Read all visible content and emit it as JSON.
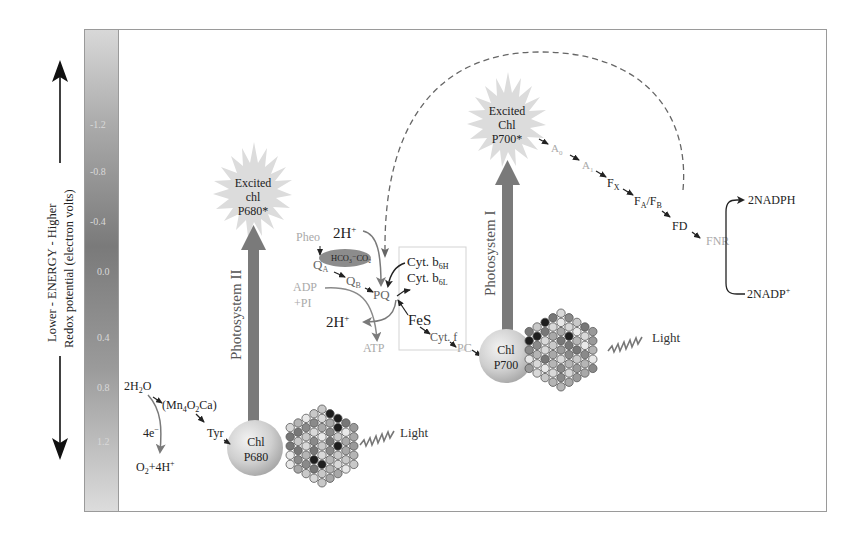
{
  "axis": {
    "energy_label": "Lower - ENERGY - Higher",
    "redox_label": "Redox potential (electron volts)",
    "ticks": [
      "-1.2",
      "-0.8",
      "-0.4",
      "0.0",
      "0.4",
      "0.8",
      "1.2"
    ]
  },
  "photosystem2": {
    "label": "Photosystem II",
    "excited": [
      "Excited",
      "chl",
      "P680*"
    ],
    "reaction_center": [
      "Chl",
      "P680"
    ],
    "light": "Light"
  },
  "photosystem1": {
    "label": "Photosystem I",
    "excited": [
      "Excited",
      "Chl",
      "P700*"
    ],
    "reaction_center": [
      "Chl",
      "P700"
    ],
    "light": "Light"
  },
  "water_splitting": {
    "water": "2H",
    "water_sub": "2",
    "water_end": "O",
    "complex": "(Mn",
    "complex_sub1": "4",
    "complex_mid": "O",
    "complex_sub2": "2",
    "complex_end": "Ca)",
    "electrons": "4e",
    "electrons_sup": "−",
    "tyr": "Tyr",
    "products": "O",
    "products_sub": "2",
    "products_end": "+4H",
    "products_sup": "+"
  },
  "chain_ps2": {
    "pheo": "Pheo",
    "qa": "Q",
    "qa_sub": "A",
    "qb": "Q",
    "qb_sub": "B",
    "bicarbonate": "HCO₃⁻CO₂",
    "pq": "PQ",
    "h_in": "2H",
    "h_in_sup": "+",
    "h_out": "2H",
    "h_out_sup": "+",
    "adp": "ADP",
    "pi": "+PI",
    "atp": "ATP"
  },
  "cytochrome_complex": {
    "cyt_b6h": "Cyt. b",
    "cyt_b6h_sub": "6H",
    "cyt_b6l": "Cyt. b",
    "cyt_b6l_sub": "6L",
    "fes": "FeS",
    "cyt_f": "Cyt. f",
    "pc": "PC"
  },
  "chain_ps1": {
    "a0": "A",
    "a0_sub": "0",
    "a1": "A",
    "a1_sub": "1",
    "fx": "F",
    "fx_sub": "X",
    "fa": "F",
    "fa_sub": "A",
    "fb": "/F",
    "fb_sub": "B",
    "fd": "FD",
    "fnr": "FNR"
  },
  "nadp": {
    "nadph": "2NADPH",
    "nadp": "2NADP",
    "nadp_sup": "+"
  },
  "colors": {
    "arrow_gray": "#7a7a7a",
    "star_fill": "#dcdcdc",
    "bicarbonate_fill": "#8c8c8c",
    "gradient_top": "#d6d6d6",
    "gradient_mid": "#7d7d7d",
    "gradient_bottom": "#dadada"
  }
}
